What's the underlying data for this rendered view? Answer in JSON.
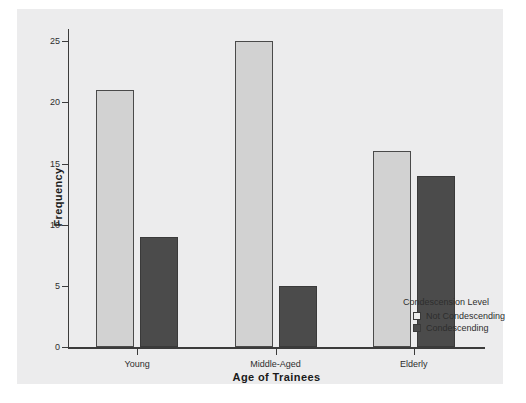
{
  "chart_data": {
    "type": "bar",
    "title": "",
    "xlabel": "Age of Trainees",
    "ylabel": "Frequency",
    "categories": [
      "Young",
      "Middle-Aged",
      "Elderly"
    ],
    "series": [
      {
        "name": "Not Condescending",
        "values": [
          21,
          25,
          16
        ],
        "color": "#d2d2d2"
      },
      {
        "name": "Condescending",
        "values": [
          9,
          5,
          14
        ],
        "color": "#4b4b4b"
      }
    ],
    "ylim": [
      0,
      26
    ],
    "yticks": [
      0,
      5,
      10,
      15,
      20,
      25
    ],
    "ytick_labels": [
      "0",
      "5",
      "10",
      "15",
      "20",
      "25"
    ],
    "grid": false,
    "legend": {
      "title": "Condescension Level",
      "position": "right-bottom",
      "entries": [
        {
          "label": "Not Condescending",
          "swatch": "light"
        },
        {
          "label": "Condescending",
          "swatch": "dark"
        }
      ]
    }
  },
  "colors": {
    "panel_background": "#ececed",
    "figure_background": "#ffffff",
    "axis": "#3b3b3b",
    "text": "#2e2e2e",
    "bar_light": "#d2d2d2",
    "bar_dark": "#4b4b4b"
  }
}
